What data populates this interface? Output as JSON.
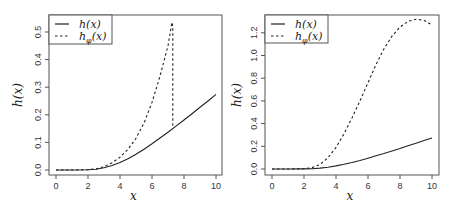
{
  "chart_data": [
    {
      "type": "line",
      "title": "",
      "xlabel": "x",
      "ylabel": "h(x)",
      "xlim": [
        0,
        10
      ],
      "ylim": [
        0,
        0.55
      ],
      "xticks": [
        "0",
        "2",
        "4",
        "6",
        "8",
        "10"
      ],
      "yticks": [
        "0.0",
        "0.1",
        "0.2",
        "0.3",
        "0.4",
        "0.5"
      ],
      "grid": false,
      "legend_position": "top-left",
      "series": [
        {
          "name": "h(x)",
          "style": "solid",
          "x": [
            0,
            1,
            2,
            2.5,
            3,
            3.5,
            4,
            4.5,
            5,
            5.5,
            6,
            6.5,
            7,
            7.5,
            8,
            8.5,
            9,
            9.5,
            10
          ],
          "y": [
            0,
            0,
            0.001,
            0.003,
            0.008,
            0.016,
            0.027,
            0.041,
            0.057,
            0.075,
            0.095,
            0.116,
            0.137,
            0.159,
            0.181,
            0.204,
            0.227,
            0.25,
            0.274
          ]
        },
        {
          "name": "h_phi(x)",
          "style": "dashed",
          "x": [
            0,
            1,
            2,
            2.5,
            3,
            3.5,
            4,
            4.5,
            5,
            5.5,
            6,
            6.5,
            7,
            7.25,
            7.3,
            7.3
          ],
          "y": [
            0,
            0,
            0.001,
            0.004,
            0.012,
            0.026,
            0.046,
            0.075,
            0.115,
            0.17,
            0.245,
            0.34,
            0.45,
            0.535,
            0.52,
            0.15
          ]
        }
      ]
    },
    {
      "type": "line",
      "title": "",
      "xlabel": "x",
      "ylabel": "h(x)",
      "xlim": [
        0,
        10
      ],
      "ylim": [
        0,
        1.32
      ],
      "xticks": [
        "0",
        "2",
        "4",
        "6",
        "8",
        "10"
      ],
      "yticks": [
        "0.0",
        "0.2",
        "0.4",
        "0.6",
        "0.8",
        "1.0",
        "1.2"
      ],
      "grid": false,
      "legend_position": "top-left",
      "series": [
        {
          "name": "h(x)",
          "style": "solid",
          "x": [
            0,
            1,
            2,
            2.5,
            3,
            3.5,
            4,
            4.5,
            5,
            5.5,
            6,
            6.5,
            7,
            7.5,
            8,
            8.5,
            9,
            9.5,
            10
          ],
          "y": [
            0,
            0,
            0.001,
            0.003,
            0.008,
            0.016,
            0.027,
            0.041,
            0.057,
            0.075,
            0.095,
            0.116,
            0.137,
            0.159,
            0.181,
            0.204,
            0.227,
            0.25,
            0.274
          ]
        },
        {
          "name": "h_phi(x)",
          "style": "dashed",
          "x": [
            0,
            1,
            2,
            2.5,
            3,
            3.5,
            4,
            4.5,
            5,
            5.5,
            6,
            6.5,
            7,
            7.5,
            8,
            8.5,
            9,
            9.5,
            10
          ],
          "y": [
            0,
            0,
            0.003,
            0.012,
            0.04,
            0.1,
            0.19,
            0.31,
            0.45,
            0.6,
            0.76,
            0.92,
            1.06,
            1.17,
            1.25,
            1.3,
            1.32,
            1.31,
            1.27
          ]
        }
      ]
    }
  ],
  "panels": [
    {
      "xlabel": "x",
      "ylabel": "h(x)",
      "legend": [
        "h(x)",
        "hφ(x)"
      ]
    },
    {
      "xlabel": "x",
      "ylabel": "h(x)",
      "legend": [
        "h(x)",
        "hφ(x)"
      ]
    }
  ]
}
